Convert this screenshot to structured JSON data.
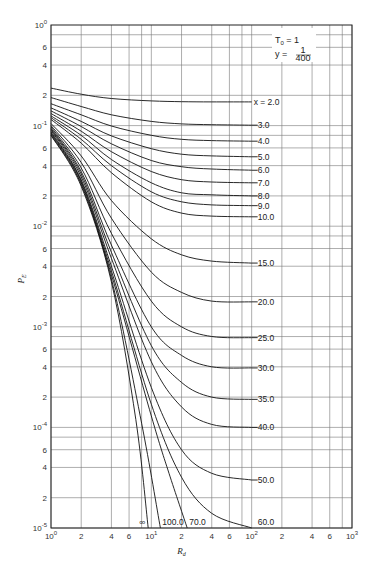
{
  "chart_data": {
    "type": "line",
    "title": "",
    "xlabel": "R_d",
    "ylabel": "P_E",
    "xscale": "log",
    "yscale": "log",
    "xlim": [
      1,
      1000
    ],
    "ylim": [
      1e-05,
      1
    ],
    "grid": true,
    "x_gridlines": [
      1,
      2,
      4,
      6,
      8,
      10,
      20,
      40,
      60,
      80,
      100,
      200,
      400,
      600,
      800,
      1000
    ],
    "y_gridline_mantissas": [
      1,
      2,
      4,
      6,
      8
    ],
    "x_ticks": [
      {
        "value": 1,
        "label": "10",
        "sup": "0"
      },
      {
        "value": 2,
        "label": "2"
      },
      {
        "value": 4,
        "label": "4"
      },
      {
        "value": 6,
        "label": "6"
      },
      {
        "value": 10,
        "label": "10",
        "sup": "1"
      },
      {
        "value": 20,
        "label": "2"
      },
      {
        "value": 40,
        "label": "4"
      },
      {
        "value": 60,
        "label": "6"
      },
      {
        "value": 100,
        "label": "10",
        "sup": "2"
      },
      {
        "value": 200,
        "label": "2"
      },
      {
        "value": 400,
        "label": "4"
      },
      {
        "value": 600,
        "label": "6"
      },
      {
        "value": 1000,
        "label": "10",
        "sup": "3"
      }
    ],
    "y_ticks": [
      {
        "value": 1,
        "label": "10",
        "sup": "0"
      },
      {
        "value": 0.6,
        "label": "6"
      },
      {
        "value": 0.4,
        "label": "4"
      },
      {
        "value": 0.2,
        "label": "2"
      },
      {
        "value": 0.1,
        "label": "10",
        "sup": "-1"
      },
      {
        "value": 0.06,
        "label": "6"
      },
      {
        "value": 0.04,
        "label": "4"
      },
      {
        "value": 0.02,
        "label": "2"
      },
      {
        "value": 0.01,
        "label": "10",
        "sup": "-2"
      },
      {
        "value": 0.006,
        "label": "6"
      },
      {
        "value": 0.004,
        "label": "4"
      },
      {
        "value": 0.002,
        "label": "2"
      },
      {
        "value": 0.001,
        "label": "10",
        "sup": "-3"
      },
      {
        "value": 0.0006,
        "label": "6"
      },
      {
        "value": 0.0004,
        "label": "4"
      },
      {
        "value": 0.0002,
        "label": "2"
      },
      {
        "value": 0.0001,
        "label": "10",
        "sup": "-4"
      },
      {
        "value": 6e-05,
        "label": "6"
      },
      {
        "value": 4e-05,
        "label": "4"
      },
      {
        "value": 2e-05,
        "label": "2"
      },
      {
        "value": 1e-05,
        "label": "10",
        "sup": "-5"
      }
    ],
    "annotation": {
      "line1": "T",
      "line1_sub": "0",
      "line1_rest": " = 1",
      "line2": "y = ",
      "frac_num": "1",
      "frac_den": "400"
    },
    "series": [
      {
        "name": "x=2.0",
        "label": "x = 2.0",
        "x": [
          1,
          2,
          4,
          10,
          20,
          40,
          100
        ],
        "y": [
          0.236,
          0.205,
          0.186,
          0.176,
          0.173,
          0.172,
          0.172
        ]
      },
      {
        "name": "x=3.0",
        "label": "3.0",
        "x": [
          1,
          2,
          4,
          10,
          20,
          40,
          100
        ],
        "y": [
          0.19,
          0.155,
          0.128,
          0.11,
          0.104,
          0.102,
          0.101
        ]
      },
      {
        "name": "x=4.0",
        "label": "4.0",
        "x": [
          1,
          2,
          4,
          10,
          20,
          40,
          100
        ],
        "y": [
          0.165,
          0.128,
          0.099,
          0.08,
          0.073,
          0.071,
          0.07
        ]
      },
      {
        "name": "x=5.0",
        "label": "5.0",
        "x": [
          1,
          2,
          4,
          10,
          20,
          40,
          100
        ],
        "y": [
          0.15,
          0.11,
          0.079,
          0.059,
          0.052,
          0.05,
          0.049
        ]
      },
      {
        "name": "x=6.0",
        "label": "6.0",
        "x": [
          1,
          2,
          4,
          10,
          20,
          40,
          100
        ],
        "y": [
          0.14,
          0.098,
          0.066,
          0.045,
          0.039,
          0.037,
          0.036
        ]
      },
      {
        "name": "x=7.0",
        "label": "7.0",
        "x": [
          1,
          2,
          4,
          10,
          20,
          40,
          100
        ],
        "y": [
          0.132,
          0.088,
          0.055,
          0.035,
          0.029,
          0.0275,
          0.027
        ]
      },
      {
        "name": "x=8.0",
        "label": "8.0",
        "x": [
          1,
          2,
          4,
          10,
          20,
          40,
          100
        ],
        "y": [
          0.125,
          0.08,
          0.046,
          0.027,
          0.0215,
          0.0205,
          0.02
        ]
      },
      {
        "name": "x=9.0",
        "label": "9.0",
        "x": [
          1,
          2,
          4,
          10,
          20,
          40,
          100
        ],
        "y": [
          0.12,
          0.073,
          0.04,
          0.022,
          0.0175,
          0.0163,
          0.016
        ]
      },
      {
        "name": "x=10.0",
        "label": "10.0",
        "x": [
          1,
          2,
          4,
          10,
          20,
          40,
          100
        ],
        "y": [
          0.115,
          0.067,
          0.034,
          0.0175,
          0.0135,
          0.0126,
          0.0124
        ]
      },
      {
        "name": "x=15.0",
        "label": "15.0",
        "x": [
          1,
          2,
          4,
          10,
          20,
          40,
          100
        ],
        "y": [
          0.105,
          0.05,
          0.018,
          0.0075,
          0.0052,
          0.0045,
          0.0043
        ]
      },
      {
        "name": "x=20.0",
        "label": "20.0",
        "x": [
          1,
          2,
          4,
          10,
          20,
          40,
          100
        ],
        "y": [
          0.1,
          0.043,
          0.012,
          0.0035,
          0.0022,
          0.0018,
          0.00177
        ]
      },
      {
        "name": "x=25.0",
        "label": "25.0",
        "x": [
          1,
          2,
          4,
          10,
          20,
          40,
          100
        ],
        "y": [
          0.097,
          0.038,
          0.0085,
          0.0018,
          0.001,
          0.0008,
          0.00078
        ]
      },
      {
        "name": "x=30.0",
        "label": "30.0",
        "x": [
          1,
          2,
          4,
          10,
          20,
          40,
          100
        ],
        "y": [
          0.094,
          0.035,
          0.0065,
          0.001,
          0.00052,
          0.0004,
          0.00039
        ]
      },
      {
        "name": "x=35.0",
        "label": "35.0",
        "x": [
          1,
          2,
          4,
          10,
          20,
          40,
          100
        ],
        "y": [
          0.092,
          0.033,
          0.0055,
          0.00065,
          0.00028,
          0.0002,
          0.00019
        ]
      },
      {
        "name": "x=40.0",
        "label": "40.0",
        "x": [
          1,
          2,
          4,
          10,
          20,
          40,
          100
        ],
        "y": [
          0.09,
          0.031,
          0.0048,
          0.00045,
          0.00016,
          0.000107,
          0.0001
        ]
      },
      {
        "name": "x=50.0",
        "label": "50.0",
        "x": [
          1,
          2,
          4,
          10,
          20,
          40,
          100
        ],
        "y": [
          0.087,
          0.029,
          0.004,
          0.00025,
          6e-05,
          3.5e-05,
          3e-05
        ]
      },
      {
        "name": "x=60.0",
        "label": "60.0",
        "x": [
          1,
          2,
          4,
          10,
          20,
          40,
          100
        ],
        "y": [
          0.085,
          0.028,
          0.0036,
          0.00017,
          3.2e-05,
          1.4e-05,
          1e-05
        ]
      },
      {
        "name": "x=70.0",
        "label": "70.0",
        "x": [
          1,
          2,
          4,
          10,
          15,
          22.8
        ],
        "y": [
          0.083,
          0.027,
          0.0033,
          0.00013,
          3.5e-05,
          1e-05
        ]
      },
      {
        "name": "x=100.0",
        "label": "100.0",
        "x": [
          1,
          2,
          4,
          8,
          12.3
        ],
        "y": [
          0.081,
          0.026,
          0.003,
          0.00011,
          1e-05
        ]
      },
      {
        "name": "x=inf",
        "label": "∞",
        "x": [
          1,
          2,
          4,
          7,
          9.3
        ],
        "y": [
          0.08,
          0.025,
          0.0028,
          0.00012,
          1e-05
        ]
      }
    ]
  }
}
